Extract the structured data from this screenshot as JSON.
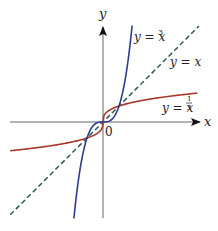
{
  "chart_data": {
    "type": "line",
    "title": "",
    "xlabel": "x",
    "ylabel": "y",
    "origin_label": "0",
    "xlim": [
      -5.8,
      6.0
    ],
    "ylim": [
      -6.0,
      6.1
    ],
    "grid": false,
    "legend": "inline labels",
    "series": [
      {
        "name": "y = x^3",
        "label": "y = x",
        "label_exp": "3",
        "color": "#2c3e8c",
        "style": "solid",
        "x": [
          -1.82,
          -1.5,
          -1.0,
          -0.5,
          0,
          0.5,
          1.0,
          1.5,
          1.82
        ],
        "y": [
          -6.03,
          -3.375,
          -1.0,
          -0.125,
          0,
          0.125,
          1.0,
          3.375,
          6.03
        ]
      },
      {
        "name": "y = x",
        "label": "y = x",
        "color": "#2e5e4e",
        "style": "dashed",
        "x": [
          -5.8,
          6.0
        ],
        "y": [
          -5.8,
          6.0
        ]
      },
      {
        "name": "y = x^(1/3)",
        "label": "y = x",
        "label_exp_num": "1",
        "label_exp_den": "3",
        "color": "#a8382a",
        "style": "solid",
        "x": [
          -5.8,
          -3.375,
          -1.0,
          -0.125,
          0,
          0.125,
          1.0,
          3.375,
          5.9
        ],
        "y": [
          -1.8,
          -1.5,
          -1.0,
          -0.5,
          0,
          0.5,
          1.0,
          1.5,
          1.81
        ]
      }
    ],
    "intersections": [
      [
        -1,
        -1
      ],
      [
        0,
        0
      ],
      [
        1,
        1
      ]
    ]
  },
  "layout": {
    "origin_px": [
      103,
      122
    ],
    "scale_px_per_unit": 16,
    "axis_color": "#666666"
  }
}
